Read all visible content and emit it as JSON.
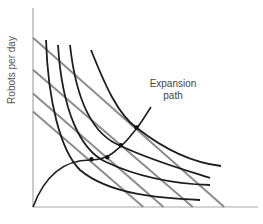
{
  "chart_data": {
    "type": "diagram",
    "title": "",
    "ylabel": "Robots per day",
    "xlabel": "",
    "annotation": {
      "text_line1": "Expansion",
      "text_line2": "path"
    },
    "isocost_lines": [
      {
        "name": "isocost-1",
        "y_intercept": 0.48,
        "x_intercept": 0.49
      },
      {
        "name": "isocost-2",
        "y_intercept": 0.57,
        "x_intercept": 0.58
      },
      {
        "name": "isocost-3",
        "y_intercept": 0.69,
        "x_intercept": 0.71
      },
      {
        "name": "isocost-4",
        "y_intercept": 0.85,
        "x_intercept": 0.85
      }
    ],
    "isoquants": [
      {
        "name": "isoquant-1"
      },
      {
        "name": "isoquant-2"
      },
      {
        "name": "isoquant-3"
      },
      {
        "name": "isoquant-4"
      }
    ],
    "expansion_path_points": [
      {
        "x": 0.26,
        "y": 0.24
      },
      {
        "x": 0.33,
        "y": 0.25
      },
      {
        "x": 0.39,
        "y": 0.31
      },
      {
        "x": 0.46,
        "y": 0.4
      }
    ],
    "colors": {
      "isocost": "#8c8c8c",
      "isoquant": "#1e1e1e",
      "axis": "#a8a8a8"
    }
  }
}
